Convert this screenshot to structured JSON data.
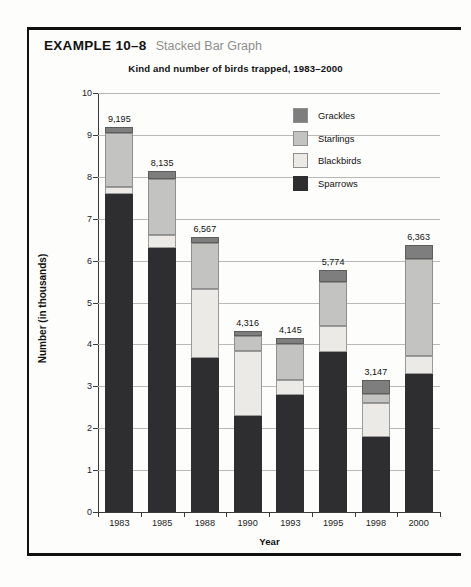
{
  "header": {
    "example_label": "EXAMPLE 10–8",
    "example_subtitle": "Stacked Bar Graph"
  },
  "chart_data": {
    "type": "bar",
    "subtype": "stacked-bar",
    "title": "Kind and number of birds trapped, 1983–2000",
    "xlabel": "Year",
    "ylabel": "Number (in thousands)",
    "grid": true,
    "legend_position": "upper-right-inside",
    "ylim": [
      0,
      10
    ],
    "yticks": [
      "10",
      "9",
      "8",
      "7",
      "6",
      "5",
      "4",
      "3",
      "2",
      "1",
      "0"
    ],
    "categories": [
      "1983",
      "1985",
      "1988",
      "1990",
      "1993",
      "1995",
      "1998",
      "2000"
    ],
    "totals": [
      "9,195",
      "8,135",
      "6,567",
      "4,316",
      "4,145",
      "5,774",
      "3,147",
      "6,363"
    ],
    "totals_numeric": [
      9.195,
      8.135,
      6.567,
      4.316,
      4.145,
      5.774,
      3.147,
      6.363
    ],
    "stack_order_bottom_to_top": [
      "Sparrows",
      "Blackbirds",
      "Starlings",
      "Grackles"
    ],
    "series": [
      {
        "name": "Sparrows",
        "color": "#2e2e30",
        "values": [
          7.6,
          6.3,
          3.67,
          2.3,
          2.8,
          3.83,
          1.8,
          3.3
        ]
      },
      {
        "name": "Blackbirds",
        "color": "#eceae6",
        "values": [
          0.15,
          0.3,
          1.66,
          1.55,
          0.35,
          0.6,
          0.8,
          0.43
        ]
      },
      {
        "name": "Starlings",
        "color": "#c3c3c1",
        "values": [
          1.3,
          1.35,
          1.09,
          0.35,
          0.87,
          1.05,
          0.22,
          2.32
        ]
      },
      {
        "name": "Grackles",
        "color": "#7e7e7e",
        "values": [
          0.145,
          0.185,
          0.147,
          0.116,
          0.125,
          0.294,
          0.327,
          0.313
        ]
      }
    ],
    "legend": [
      {
        "label": "Grackles",
        "color": "#7e7e7e"
      },
      {
        "label": "Starlings",
        "color": "#c3c3c1"
      },
      {
        "label": "Blackbirds",
        "color": "#eceae6"
      },
      {
        "label": "Sparrows",
        "color": "#2e2e30"
      }
    ]
  }
}
